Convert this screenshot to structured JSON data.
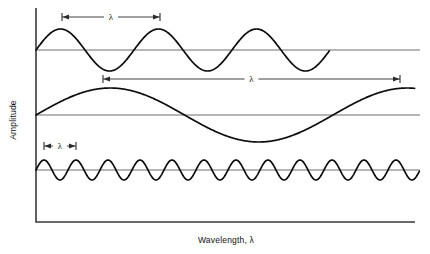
{
  "figure": {
    "title": "",
    "y_axis_label": "Amplitude",
    "x_axis_label": "Wavelength, λ",
    "lambda_symbol": "λ",
    "colors": {
      "wave": "#0d0d0d",
      "axis": "#3a3a3a",
      "baseline": "#6e6e6e",
      "annotation": "#2b2b2b",
      "background": "#ffffff"
    }
  },
  "chart_data": {
    "type": "line",
    "title": "",
    "xlabel": "Wavelength, λ",
    "ylabel": "Amplitude",
    "grid": false,
    "legend": "none",
    "axes": {
      "x_axis_y": 222,
      "x_axis_start": 36,
      "x_axis_end": 415,
      "y_axis_x": 36,
      "y_axis_top": 8,
      "y_axis_bottom": 222
    },
    "series": [
      {
        "name": "long-amplitude-medium-wavelength-wave",
        "position": "top",
        "baseline_y": 50,
        "amplitude_px": 21,
        "wavelength_px": 98,
        "cycles": 3.0,
        "x_start": 36,
        "x_end": 330,
        "phase": "sine-rising-from-baseline",
        "lambda_marker": {
          "label": "λ",
          "x_start": 62,
          "x_end": 160,
          "y": 17
        }
      },
      {
        "name": "large-amplitude-long-wavelength-wave",
        "position": "middle",
        "baseline_y": 115,
        "amplitude_px": 27,
        "wavelength_px": 297,
        "cycles": 1.3,
        "x_start": 36,
        "x_end": 415,
        "phase": "sine-rising-from-baseline",
        "lambda_marker": {
          "label": "λ",
          "x_start": 103,
          "x_end": 400,
          "y": 79
        }
      },
      {
        "name": "small-amplitude-short-wavelength-wave",
        "position": "bottom",
        "baseline_y": 170,
        "amplitude_px": 10,
        "wavelength_px": 32,
        "cycles": 12.0,
        "x_start": 36,
        "x_end": 420,
        "phase": "sine-rising-from-baseline",
        "lambda_marker": {
          "label": "λ",
          "x_start": 44,
          "x_end": 76,
          "y": 146
        }
      }
    ]
  }
}
